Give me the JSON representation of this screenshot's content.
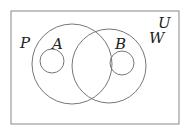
{
  "diagram": {
    "type": "venn",
    "universal_set": {
      "label": "U"
    },
    "sets": [
      {
        "label": "P",
        "cx": 72,
        "cy": 64,
        "r": 40
      },
      {
        "label": "W",
        "cx": 109,
        "cy": 66,
        "r": 37
      },
      {
        "label": "A",
        "cx": 52,
        "cy": 61,
        "r": 12
      },
      {
        "label": "B",
        "cx": 122,
        "cy": 63,
        "r": 12
      }
    ],
    "stroke_color": "#777777"
  }
}
